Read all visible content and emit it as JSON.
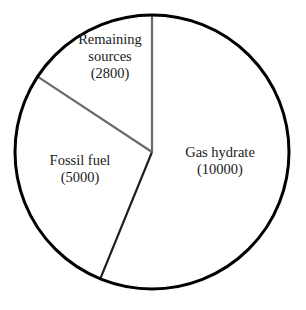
{
  "chart_data": {
    "type": "pie",
    "title": "",
    "subtitle": "",
    "xlabel": "",
    "ylabel": "",
    "legend_position": "none",
    "grid": false,
    "total": 17800,
    "units": "",
    "categories": [
      "Gas hydrate",
      "Fossil fuel",
      "Remaining sources"
    ],
    "values": [
      10000,
      5000,
      2800
    ],
    "slices": [
      {
        "label": "Gas hydrate",
        "value": 10000,
        "value_text": "(10000)",
        "percent": 56.2,
        "start_angle_deg": 0,
        "end_angle_deg": 202.2,
        "fill": "#ffffff",
        "label_x": 220,
        "label_y": 162,
        "label_lines": [
          "Gas hydrate",
          "(10000)"
        ]
      },
      {
        "label": "Fossil fuel",
        "value": 5000,
        "value_text": "(5000)",
        "percent": 28.1,
        "start_angle_deg": 202.2,
        "end_angle_deg": 303.4,
        "fill": "#ffffff",
        "label_x": 80,
        "label_y": 170,
        "label_lines": [
          "Fossil fuel",
          "(5000)"
        ]
      },
      {
        "label": "Remaining sources",
        "value": 2800,
        "value_text": "(2800)",
        "percent": 15.7,
        "start_angle_deg": 303.4,
        "end_angle_deg": 360,
        "fill": "#ffffff",
        "label_x": 110,
        "label_y": 58,
        "label_lines": [
          "Remaining",
          "sources",
          "(2800)"
        ]
      }
    ],
    "geometry": {
      "center_x": 152,
      "center_y": 152,
      "radius": 137
    },
    "style": {
      "outline_color": "#000000",
      "outline_width": 3,
      "divider_color_primary": "#6a6a6a",
      "divider_color_secondary": "#1f1f1f",
      "background": "#ffffff"
    }
  },
  "labels": {
    "gas_hydrate_name": "Gas hydrate",
    "gas_hydrate_value": "(10000)",
    "fossil_fuel_name": "Fossil fuel",
    "fossil_fuel_value": "(5000)",
    "remaining_name_line1": "Remaining",
    "remaining_name_line2": "sources",
    "remaining_value": "(2800)"
  }
}
